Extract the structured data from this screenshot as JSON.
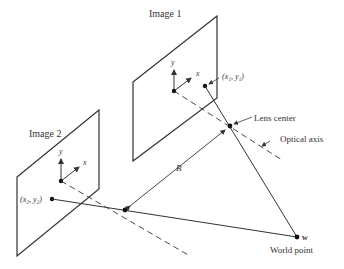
{
  "diagram": {
    "labels": {
      "image1": "Image 1",
      "image2": "Image 2",
      "point1": "(x₁, y₁)",
      "point2": "(x₂, y₂)",
      "lens_center": "Lens center",
      "optical_axis": "Optical axis",
      "baseline": "B",
      "world_point_symbol": "w",
      "world_point": "World point",
      "axis_x": "x",
      "axis_y": "y"
    },
    "colors": {
      "line": "#333333",
      "text": "#333333",
      "background": "#ffffff"
    }
  }
}
